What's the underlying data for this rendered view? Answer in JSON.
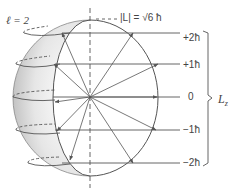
{
  "diagram": {
    "quantum_number_label": "ℓ = 2",
    "magnitude_label": "|L| = √6 ħ",
    "axis_label": "Lz",
    "axis_label_main": "L",
    "axis_label_sub": "z",
    "m_levels": [
      {
        "label": "+2ħ",
        "value": 2
      },
      {
        "label": "+1ħ",
        "value": 1
      },
      {
        "label": "0",
        "value": 0
      },
      {
        "label": "−1ħ",
        "value": -1
      },
      {
        "label": "−2ħ",
        "value": -2
      }
    ],
    "colors": {
      "line": "#555555",
      "sphere_shade": "#c8c8c8",
      "text": "#444444"
    }
  }
}
